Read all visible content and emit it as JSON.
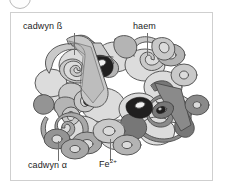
{
  "figure": {
    "badge_icon": "circle-badge-icon",
    "frame_color": "#cfcfcf",
    "background_color": "#ffffff",
    "labels": {
      "beta_chain": "cadwyn ß",
      "haem": "haem",
      "alpha_chain": "cadwyn α",
      "iron_ion": "Fe",
      "iron_ion_charge": "2+"
    },
    "leader_lines": [
      {
        "name": "leader-line-beta-chain"
      },
      {
        "name": "leader-line-haem"
      },
      {
        "name": "leader-line-alpha-chain"
      },
      {
        "name": "leader-line-iron-ion"
      }
    ],
    "palette": {
      "chain_light": "#c9c9c9",
      "chain_light_shade": "#b4b4b4",
      "chain_medium": "#a8a8a8",
      "chain_medium_shade": "#949494",
      "chain_dark": "#8a8a8a",
      "chain_dark_shade": "#777777",
      "chain_pale": "#dcdcdc",
      "haem_group": "#201f1f",
      "outline": "#4a4a4a",
      "highlight": "#f1f1f1"
    }
  }
}
